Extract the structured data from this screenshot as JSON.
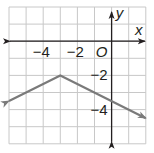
{
  "graph": {
    "x_axis_label": "x",
    "y_axis_label": "y",
    "origin_label": "O",
    "x_tick_labels": [
      {
        "value": -4,
        "text": "−4"
      },
      {
        "value": -2,
        "text": "−2"
      }
    ],
    "y_tick_labels": [
      {
        "value": -2,
        "text": "−2"
      },
      {
        "value": -4,
        "text": "−4"
      }
    ],
    "x_range": [
      -6,
      2
    ],
    "y_range": [
      -6,
      2
    ],
    "grid_step": 1,
    "colors": {
      "grid": "#c8c8c8",
      "axis": "#231f20",
      "curve": "#7a7a7a",
      "background": "#ffffff"
    }
  },
  "chart_data": {
    "type": "line",
    "title": "",
    "xlabel": "x",
    "ylabel": "y",
    "xlim": [
      -6,
      2
    ],
    "ylim": [
      -6,
      2
    ],
    "grid": true,
    "series": [
      {
        "name": "y = -1/2|x + 3| - 2",
        "x": [
          -6,
          -3,
          2
        ],
        "y": [
          -3.5,
          -2,
          -4.5
        ],
        "arrows_at_ends": true,
        "vertex": [
          -3,
          -2
        ]
      }
    ]
  }
}
